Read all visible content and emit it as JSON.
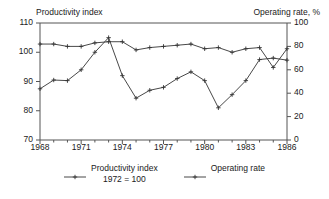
{
  "chart_data": {
    "type": "line",
    "title": "",
    "titles": {
      "left": "Productivity index",
      "right": "Operating rate, %"
    },
    "xlabel": "",
    "x": [
      1968,
      1969,
      1970,
      1971,
      1972,
      1973,
      1974,
      1975,
      1976,
      1977,
      1978,
      1979,
      1980,
      1981,
      1982,
      1983,
      1984,
      1985,
      1986
    ],
    "xlim": [
      1968,
      1986
    ],
    "xticks": [
      1968,
      1971,
      1974,
      1977,
      1980,
      1983,
      1986
    ],
    "xtick_labels": [
      "1968",
      "1971",
      "1974",
      "1977",
      "1980",
      "1983",
      "1986"
    ],
    "xminor_every": 1,
    "grid": false,
    "legend_position": "bottom",
    "axes": [
      {
        "id": "left",
        "label": "Productivity index",
        "ylim": [
          70,
          110
        ],
        "yticks": [
          70,
          80,
          90,
          100,
          110
        ],
        "ytick_labels": [
          "70",
          "80",
          "90",
          "100",
          "110"
        ]
      },
      {
        "id": "right",
        "label": "Operating rate, %",
        "ylim": [
          0,
          100
        ],
        "yticks": [
          0,
          20,
          40,
          60,
          80,
          100
        ],
        "ytick_labels": [
          "0",
          "20",
          "40",
          "60",
          "80",
          "100"
        ]
      }
    ],
    "series": [
      {
        "name": "Productivity index",
        "axis": "left",
        "note": "1972 = 100",
        "marker": "plus",
        "color": "#333333",
        "values": [
          87.5,
          90.5,
          90.3,
          94.0,
          100.0,
          105.0,
          92.0,
          84.3,
          87.0,
          88.0,
          91.0,
          93.3,
          90.3,
          81.0,
          85.5,
          90.3,
          97.5,
          98.0,
          97.3
        ]
      },
      {
        "name": "Operating rate",
        "axis": "right",
        "marker": "plus",
        "color": "#333333",
        "values": [
          82,
          82,
          80,
          80,
          83,
          84,
          84,
          77,
          79,
          80,
          81,
          82,
          78,
          79,
          75,
          78,
          79,
          62,
          78
        ]
      }
    ],
    "annotations": [
      {
        "text": "1972 = 100",
        "attached_to": "Productivity index"
      }
    ]
  },
  "legend": {
    "items": [
      {
        "label": "Productivity index",
        "sublabel": "1972 = 100"
      },
      {
        "label": "Operating rate",
        "sublabel": ""
      }
    ]
  }
}
